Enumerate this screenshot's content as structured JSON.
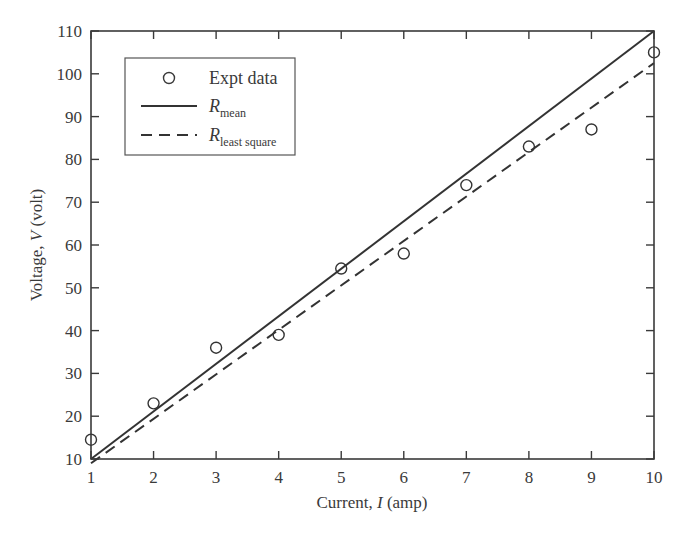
{
  "chart_data": {
    "type": "line",
    "title": "",
    "xlabel": "Current, I (amp)",
    "ylabel": "Voltage, V (volt)",
    "xlabel_parts": {
      "prefix": "Current, ",
      "var": "I",
      "suffix": " (amp)"
    },
    "ylabel_parts": {
      "prefix": "Voltage, ",
      "var": "V",
      "suffix": " (volt)"
    },
    "xlim": [
      1,
      10
    ],
    "ylim": [
      10,
      110
    ],
    "xticks": [
      1,
      2,
      3,
      4,
      5,
      6,
      7,
      8,
      9,
      10
    ],
    "yticks": [
      10,
      20,
      30,
      40,
      50,
      60,
      70,
      80,
      90,
      100,
      110
    ],
    "grid": false,
    "legend_position": "upper left",
    "series": [
      {
        "name": "Expt data",
        "style": "scatter-open-circle",
        "x": [
          1,
          2,
          3,
          4,
          5,
          6,
          7,
          8,
          9,
          10
        ],
        "y": [
          14.5,
          23,
          36,
          39,
          54.5,
          58,
          74,
          83,
          87,
          105
        ]
      },
      {
        "name": "R_mean",
        "legend_main": "R",
        "legend_sub": "mean",
        "style": "solid-line",
        "x": [
          1,
          10
        ],
        "y": [
          10,
          110
        ]
      },
      {
        "name": "R_least square",
        "legend_main": "R",
        "legend_sub": "least square",
        "style": "dashed-line",
        "x": [
          1,
          10
        ],
        "y": [
          9,
          102.5
        ]
      }
    ]
  },
  "colors": {
    "axis": "#3a3a3a",
    "line": "#333333",
    "background": "#ffffff"
  }
}
